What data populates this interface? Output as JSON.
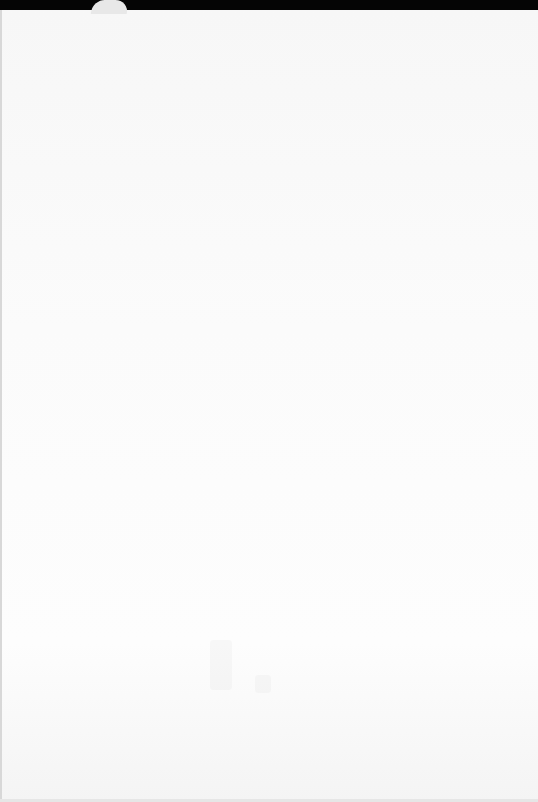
{
  "scene": {
    "description": "Blank white paper sheet on black background",
    "background_color": "#000000",
    "page_color": "#fbfbfb",
    "tab_color": "#e8e8e8"
  },
  "page": {
    "text": ""
  }
}
